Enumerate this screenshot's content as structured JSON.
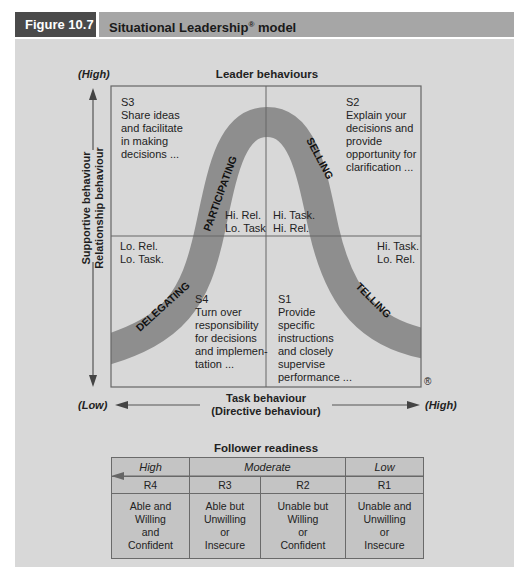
{
  "header": {
    "figure_number": "Figure 10.7",
    "title": "Situational Leadership",
    "title_mark": "®",
    "title_suffix": " model"
  },
  "colors": {
    "figure_number_bg": "#4a4a4a",
    "title_bg": "#a6a6a6",
    "panel_bg": "#d8d8d8",
    "curve": "#8e8e8e",
    "grid_line": "#666666"
  },
  "diagram": {
    "top_label": "Leader behaviours",
    "y_axis": {
      "high": "(High)",
      "low": "(Low)",
      "label_line1": "Supportive behaviour",
      "label_line2": "Relationship behaviour"
    },
    "x_axis": {
      "low": "(Low)",
      "high": "(High)",
      "label_line1": "Task behaviour",
      "label_line2": "(Directive behaviour)"
    },
    "registered_mark": "®",
    "curve_labels": {
      "participating": "PARTICIPATING",
      "selling": "SELLING",
      "delegating": "DELEGATING",
      "telling": "TELLING"
    },
    "quadrants": {
      "s3": {
        "code": "S3",
        "lines": [
          "Share ideas",
          "and facilitate",
          "in making",
          "decisions ..."
        ],
        "tag1": "Hi. Rel.",
        "tag2": "Lo. Task"
      },
      "s2": {
        "code": "S2",
        "lines": [
          "Explain your",
          "decisions and",
          "provide",
          "opportunity for",
          "clarification ..."
        ],
        "tag1": "Hi. Task.",
        "tag2": "Hi. Rel."
      },
      "s4": {
        "code": "S4",
        "lines": [
          "Turn over",
          "responsibility",
          "for decisions",
          "and implemen-",
          "tation ..."
        ],
        "tag1": "Lo. Rel.",
        "tag2": "Lo. Task."
      },
      "s1": {
        "code": "S1",
        "lines": [
          "Provide",
          "specific",
          "instructions",
          "and closely",
          "supervise",
          "performance ..."
        ],
        "tag1": "Hi. Task.",
        "tag2": "Lo. Rel."
      }
    }
  },
  "readiness": {
    "title": "Follower readiness",
    "levels": [
      "High",
      "Moderate",
      "Low"
    ],
    "codes": [
      "R4",
      "R3",
      "R2",
      "R1"
    ],
    "descriptions": [
      [
        "Able and",
        "Willing",
        "and",
        "Confident"
      ],
      [
        "Able but",
        "Unwilling",
        "or",
        "Insecure"
      ],
      [
        "Unable but",
        "Willing",
        "or",
        "Confident"
      ],
      [
        "Unable and",
        "Unwilling",
        "or",
        "Insecure"
      ]
    ]
  }
}
